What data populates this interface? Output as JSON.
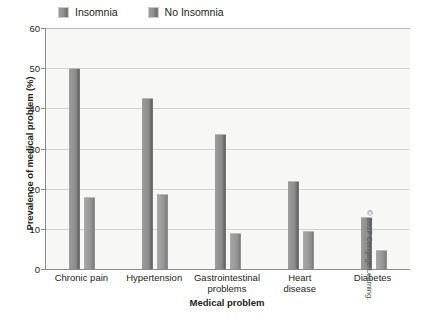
{
  "chart_data": {
    "type": "bar",
    "title": "",
    "xlabel": "Medical problem",
    "ylabel": "Prevalence of medical problem (%)",
    "categories": [
      "Chronic pain",
      "Hypertension",
      "Gastrointestinal problems",
      "Heart disease",
      "Diabetes"
    ],
    "category_lines": [
      [
        "Chronic pain"
      ],
      [
        "Hypertension"
      ],
      [
        "Gastrointestinal",
        "problems"
      ],
      [
        "Heart",
        "disease"
      ],
      [
        "Diabetes"
      ]
    ],
    "series": [
      {
        "name": "Insomnia",
        "values": [
          50.0,
          42.7,
          33.6,
          21.8,
          13.0
        ],
        "color": "#8b8b8b"
      },
      {
        "name": "No Insomnia",
        "values": [
          17.9,
          18.7,
          9.0,
          9.5,
          4.8
        ],
        "color": "#9b9b9b"
      }
    ],
    "ylim": [
      0,
      60
    ],
    "yticks": [
      0,
      10,
      20,
      30,
      40,
      50,
      60
    ],
    "ytick_labels": [
      "0",
      "10",
      "20",
      "30",
      "40",
      "50",
      "60"
    ],
    "grid": true,
    "legend_position": "top-left",
    "plot_background": "#f7f7f6",
    "gridline_color": "#d2d2d2",
    "axis_color": "#8c8c8c"
  },
  "legend": {
    "entries": [
      {
        "label": "Insomnia",
        "swatch": "legend-swatch-insomnia"
      },
      {
        "label": "No Insomnia",
        "swatch": "legend-swatch-no-insomnia"
      }
    ]
  },
  "footer": {
    "copyright": "© 2017 Cengage Learning."
  }
}
